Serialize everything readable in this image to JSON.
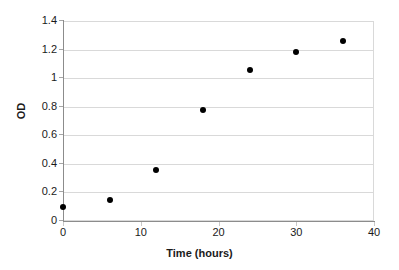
{
  "chart_data": {
    "type": "scatter",
    "title": "",
    "xlabel": "Time (hours)",
    "ylabel": "OD",
    "xlim": [
      0,
      40
    ],
    "ylim": [
      0,
      1.4
    ],
    "xticks": [
      0,
      10,
      20,
      30,
      40
    ],
    "xtick_labels": [
      "0",
      "10",
      "20",
      "30",
      "40"
    ],
    "yticks": [
      0,
      0.2,
      0.4,
      0.6,
      0.8,
      1.0,
      1.2,
      1.4
    ],
    "ytick_labels": [
      "0",
      "0.2",
      "0.4",
      "0.6",
      "0.8",
      "1",
      "1.2",
      "1.4"
    ],
    "grid": "horizontal",
    "legend": "none",
    "marker": {
      "shape": "circle",
      "color": "#000000",
      "size": 6
    },
    "series": [
      {
        "name": "OD",
        "x": [
          0,
          6,
          12,
          18,
          24,
          30,
          36
        ],
        "y": [
          0.095,
          0.145,
          0.36,
          0.78,
          1.06,
          1.18,
          1.26
        ]
      }
    ],
    "points": [
      {
        "x": 0,
        "y": 0.095
      },
      {
        "x": 6,
        "y": 0.145
      },
      {
        "x": 12,
        "y": 0.36
      },
      {
        "x": 18,
        "y": 0.78
      },
      {
        "x": 24,
        "y": 1.06
      },
      {
        "x": 30,
        "y": 1.18
      },
      {
        "x": 36,
        "y": 1.26
      }
    ],
    "colors": {
      "background": "#ffffff",
      "gridline": "#d9d9d9",
      "axis_line": "#8c8c8c",
      "text": "#1a1a1a",
      "marker": "#000000"
    }
  }
}
